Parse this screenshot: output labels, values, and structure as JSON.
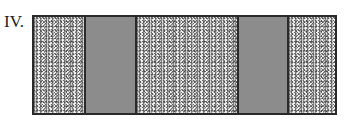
{
  "figure": {
    "label": "IV.",
    "segments": [
      {
        "type": "speckled",
        "width": 50
      },
      {
        "type": "gray",
        "width": 51
      },
      {
        "type": "speckled",
        "width": 102
      },
      {
        "type": "gray",
        "width": 50
      },
      {
        "type": "speckled",
        "width": 48
      }
    ],
    "colors": {
      "border": "#2a2a2a",
      "gray_fill": "#8c8c8c",
      "speckle_bg": "#f2f2f2"
    }
  }
}
